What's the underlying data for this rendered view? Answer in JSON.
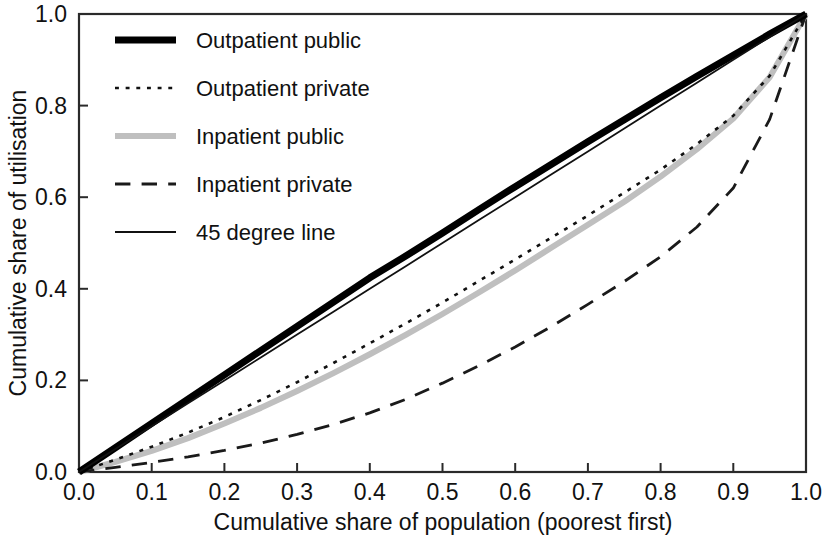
{
  "chart_data": {
    "type": "line",
    "title": "",
    "subtitle": "",
    "xlabel": "Cumulative share of population (poorest first)",
    "ylabel": "Cumulative share of utilisation",
    "xlim": [
      0.0,
      1.0
    ],
    "ylim": [
      0.0,
      1.0
    ],
    "grid": false,
    "legend_position": "top-left inside",
    "xticks": [
      "0.0",
      "0.1",
      "0.2",
      "0.3",
      "0.4",
      "0.5",
      "0.6",
      "0.7",
      "0.8",
      "0.9",
      "1.0"
    ],
    "xtick_values": [
      0.0,
      0.1,
      0.2,
      0.3,
      0.4,
      0.5,
      0.6,
      0.7,
      0.8,
      0.9,
      1.0
    ],
    "yticks": [
      "0.0",
      "0.2",
      "0.4",
      "0.6",
      "0.8",
      "1.0"
    ],
    "ytick_values": [
      0.0,
      0.2,
      0.4,
      0.6,
      0.8,
      1.0
    ],
    "x": [
      0.0,
      0.05,
      0.1,
      0.15,
      0.2,
      0.25,
      0.3,
      0.35,
      0.4,
      0.45,
      0.5,
      0.55,
      0.6,
      0.65,
      0.7,
      0.75,
      0.8,
      0.85,
      0.9,
      0.95,
      1.0
    ],
    "series": [
      {
        "name": "Outpatient public",
        "color": "#000000",
        "style": "solid",
        "width": 7,
        "values": [
          0.0,
          0.053,
          0.106,
          0.159,
          0.212,
          0.265,
          0.318,
          0.371,
          0.424,
          0.472,
          0.522,
          0.573,
          0.623,
          0.672,
          0.721,
          0.769,
          0.817,
          0.864,
          0.91,
          0.956,
          1.0
        ]
      },
      {
        "name": "Outpatient private",
        "color": "#111111",
        "style": "dotted",
        "width": 2.6,
        "values": [
          0.0,
          0.027,
          0.055,
          0.086,
          0.12,
          0.157,
          0.196,
          0.238,
          0.281,
          0.325,
          0.37,
          0.417,
          0.464,
          0.512,
          0.56,
          0.61,
          0.66,
          0.716,
          0.778,
          0.865,
          1.0
        ]
      },
      {
        "name": "Inpatient public",
        "color": "#bfbfbf",
        "style": "solid",
        "width": 6,
        "values": [
          0.0,
          0.022,
          0.046,
          0.074,
          0.106,
          0.14,
          0.177,
          0.216,
          0.257,
          0.3,
          0.345,
          0.392,
          0.44,
          0.49,
          0.54,
          0.59,
          0.645,
          0.705,
          0.772,
          0.862,
          1.0
        ]
      },
      {
        "name": "Inpatient private",
        "color": "#1a1a1a",
        "style": "dashed",
        "width": 2.8,
        "values": [
          0.0,
          0.01,
          0.021,
          0.033,
          0.047,
          0.063,
          0.082,
          0.104,
          0.129,
          0.159,
          0.194,
          0.232,
          0.273,
          0.318,
          0.366,
          0.416,
          0.47,
          0.535,
          0.62,
          0.77,
          1.0
        ]
      },
      {
        "name": "45 degree line",
        "color": "#111111",
        "style": "solid",
        "width": 1.8,
        "values": [
          0.0,
          0.05,
          0.1,
          0.15,
          0.2,
          0.25,
          0.3,
          0.35,
          0.4,
          0.45,
          0.5,
          0.55,
          0.6,
          0.65,
          0.7,
          0.75,
          0.8,
          0.85,
          0.9,
          0.95,
          1.0
        ]
      }
    ]
  },
  "legend": {
    "items": [
      {
        "label": "Outpatient public"
      },
      {
        "label": "Outpatient private"
      },
      {
        "label": "Inpatient public"
      },
      {
        "label": "Inpatient private"
      },
      {
        "label": "45 degree line"
      }
    ]
  },
  "axes": {
    "x_title": "Cumulative share of population (poorest first)",
    "y_title": "Cumulative share of utilisation",
    "x_tick_labels": [
      "0.0",
      "0.1",
      "0.2",
      "0.3",
      "0.4",
      "0.5",
      "0.6",
      "0.7",
      "0.8",
      "0.9",
      "1.0"
    ],
    "y_tick_labels": [
      "0.0",
      "0.2",
      "0.4",
      "0.6",
      "0.8",
      "1.0"
    ]
  }
}
